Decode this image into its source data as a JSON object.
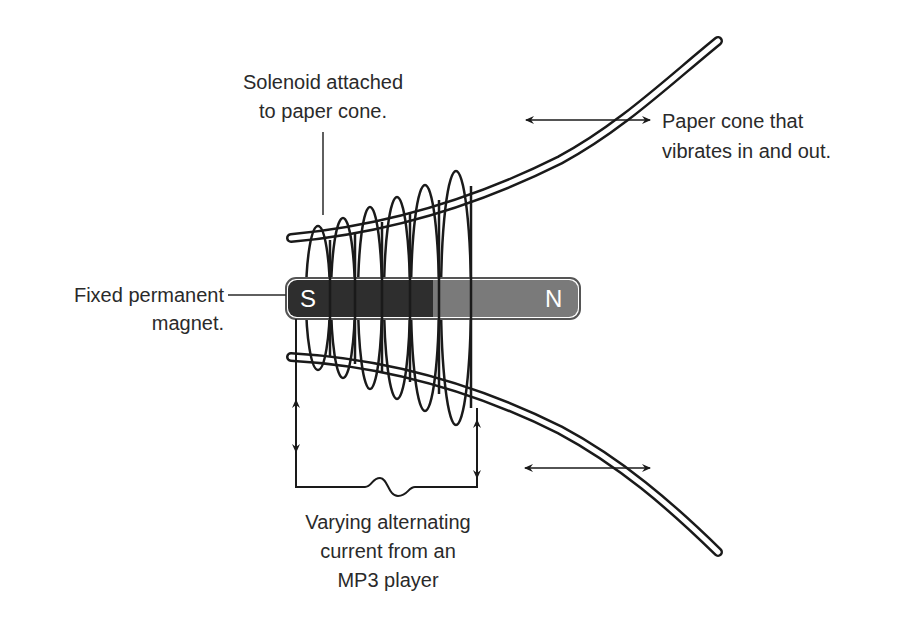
{
  "diagram": {
    "labels": {
      "solenoid": {
        "line1": "Solenoid attached",
        "line2": "to paper cone."
      },
      "cone": {
        "line1": "Paper cone that",
        "line2": "vibrates in and out."
      },
      "magnet": {
        "line1": "Fixed permanent",
        "line2": "magnet."
      },
      "current": {
        "line1": "Varying alternating",
        "line2": "current from an",
        "line3": "MP3 player"
      }
    },
    "magnet": {
      "south_label": "S",
      "north_label": "N",
      "south_color": "#2e2e2e",
      "north_color": "#7a7a7a"
    },
    "coil": {
      "turns": 6
    },
    "colors": {
      "ink": "#1a1a1a",
      "text": "#2a2a2a",
      "background": "#ffffff"
    }
  }
}
